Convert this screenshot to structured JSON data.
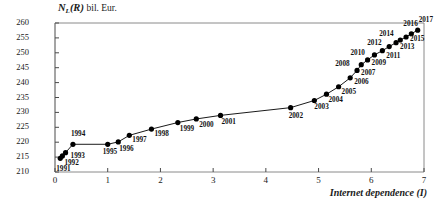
{
  "chart_data": {
    "type": "line",
    "title": "",
    "ylabel": "N_L(R) bil. Eur.",
    "ylabel_main": "N",
    "ylabel_sub": "L",
    "ylabel_paren": "(R)",
    "ylabel_unit": "bil. Eur.",
    "xlabel": "Internet dependence (I)",
    "xlim": [
      0,
      7
    ],
    "ylim": [
      210,
      260
    ],
    "xticks": [
      "0",
      "1",
      "2",
      "3",
      "4",
      "5",
      "6",
      "7"
    ],
    "yticks": [
      "210",
      "215",
      "220",
      "225",
      "230",
      "235",
      "240",
      "245",
      "250",
      "255",
      "260"
    ],
    "grid": false,
    "legend": "none",
    "marker": "filled-circle",
    "line_color": "#000000",
    "marker_color": "#000000",
    "points": [
      {
        "label": "1991",
        "x": 0.1,
        "y": 214.6,
        "lx": -4,
        "ly": 11
      },
      {
        "label": "1992",
        "x": 0.14,
        "y": 215.4,
        "lx": 2,
        "ly": 7
      },
      {
        "label": "1993",
        "x": 0.2,
        "y": 216.5,
        "lx": 5,
        "ly": 3
      },
      {
        "label": "1994",
        "x": 0.34,
        "y": 219.3,
        "lx": -2,
        "ly": -10
      },
      {
        "label": "1995",
        "x": 1.0,
        "y": 219.3,
        "lx": -5,
        "ly": 8
      },
      {
        "label": "1996",
        "x": 1.2,
        "y": 220.1,
        "lx": 1,
        "ly": 7
      },
      {
        "label": "1997",
        "x": 1.41,
        "y": 222.3,
        "lx": 3,
        "ly": 5
      },
      {
        "label": "1998",
        "x": 1.83,
        "y": 224.4,
        "lx": 3,
        "ly": 5
      },
      {
        "label": "1999",
        "x": 2.33,
        "y": 226.6,
        "lx": 2,
        "ly": 6
      },
      {
        "label": "2000",
        "x": 2.68,
        "y": 227.8,
        "lx": 3,
        "ly": 6
      },
      {
        "label": "2001",
        "x": 3.14,
        "y": 229.0,
        "lx": 1,
        "ly": 7
      },
      {
        "label": "2002",
        "x": 4.47,
        "y": 231.6,
        "lx": -2,
        "ly": 8
      },
      {
        "label": "2003",
        "x": 4.92,
        "y": 234.0,
        "lx": 0,
        "ly": 7
      },
      {
        "label": "2004",
        "x": 5.15,
        "y": 236.1,
        "lx": 2,
        "ly": 6
      },
      {
        "label": "2005",
        "x": 5.38,
        "y": 238.6,
        "lx": 3,
        "ly": 5
      },
      {
        "label": "2006",
        "x": 5.6,
        "y": 241.6,
        "lx": 4,
        "ly": 4
      },
      {
        "label": "2007",
        "x": 5.73,
        "y": 244.1,
        "lx": 4,
        "ly": 3
      },
      {
        "label": "2008",
        "x": 5.81,
        "y": 246.0,
        "lx": -26,
        "ly": -1
      },
      {
        "label": "2009",
        "x": 5.93,
        "y": 247.6,
        "lx": 4,
        "ly": 3
      },
      {
        "label": "2010",
        "x": 6.06,
        "y": 249.3,
        "lx": -24,
        "ly": -2
      },
      {
        "label": "2011",
        "x": 6.21,
        "y": 250.7,
        "lx": 4,
        "ly": 5
      },
      {
        "label": "2012",
        "x": 6.34,
        "y": 252.1,
        "lx": -22,
        "ly": -4
      },
      {
        "label": "2013",
        "x": 6.47,
        "y": 253.4,
        "lx": 4,
        "ly": 4
      },
      {
        "label": "2014",
        "x": 6.55,
        "y": 254.3,
        "lx": -21,
        "ly": -6
      },
      {
        "label": "2015",
        "x": 6.66,
        "y": 255.3,
        "lx": 4,
        "ly": 2
      },
      {
        "label": "2016",
        "x": 6.76,
        "y": 256.4,
        "lx": -8,
        "ly": -10
      },
      {
        "label": "2017",
        "x": 6.88,
        "y": 257.6,
        "lx": 1,
        "ly": -10
      }
    ]
  }
}
